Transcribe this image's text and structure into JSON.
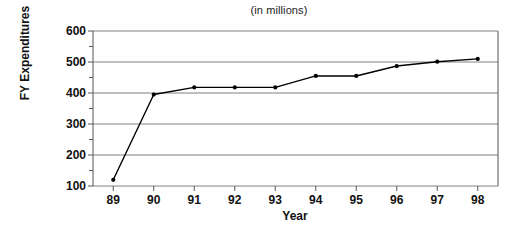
{
  "chart_data": {
    "type": "line",
    "title": "(in millions)",
    "subtitle": "",
    "xlabel": "Year",
    "ylabel": "FY Expenditures",
    "categories": [
      "89",
      "90",
      "91",
      "92",
      "93",
      "94",
      "95",
      "96",
      "97",
      "98"
    ],
    "x": [
      89,
      90,
      91,
      92,
      93,
      94,
      95,
      96,
      97,
      98
    ],
    "values": [
      120,
      395,
      418,
      418,
      418,
      455,
      455,
      487,
      501,
      510
    ],
    "series": [
      {
        "name": "FY Expenditures",
        "values": [
          120,
          395,
          418,
          418,
          418,
          455,
          455,
          487,
          501,
          510
        ]
      }
    ],
    "ylim": [
      100,
      600
    ],
    "ytick_labels": [
      "100",
      "200",
      "300",
      "400",
      "500",
      "600"
    ],
    "ytick_values": [
      100,
      200,
      300,
      400,
      500,
      600
    ],
    "yminor_values": [
      150,
      250,
      350,
      450,
      550
    ],
    "xtick_labels": [
      "89",
      "90",
      "91",
      "92",
      "93",
      "94",
      "95",
      "96",
      "97",
      "98"
    ],
    "grid": true,
    "grid_axis": "y",
    "legend": false,
    "legend_position": "none",
    "marker": "filled-circle",
    "line_color": "#000000",
    "marker_color": "#000000",
    "grid_color": "#808080",
    "axis_color": "#555555",
    "background_color": "#ffffff"
  },
  "axis": {
    "y_labels": [
      "600",
      "500",
      "400",
      "300",
      "200",
      "100"
    ],
    "x_labels": [
      "89",
      "90",
      "91",
      "92",
      "93",
      "94",
      "95",
      "96",
      "97",
      "98"
    ]
  },
  "labels": {
    "title": "(in millions)",
    "x_axis_title": "Year",
    "y_axis_title": "FY Expenditures"
  }
}
